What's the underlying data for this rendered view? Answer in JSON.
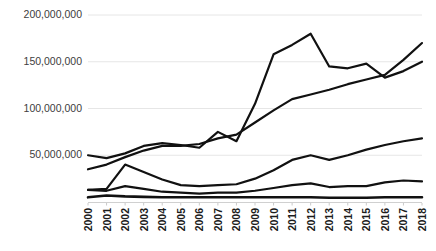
{
  "chart_data": {
    "type": "line",
    "title": "",
    "subtitle": "",
    "xlabel": "",
    "ylabel": "",
    "x": [
      2000,
      2001,
      2002,
      2003,
      2004,
      2005,
      2006,
      2007,
      2008,
      2009,
      2010,
      2011,
      2012,
      2013,
      2014,
      2015,
      2016,
      2017,
      2018
    ],
    "categories": [
      "2000",
      "2001",
      "2002",
      "2003",
      "2004",
      "2005",
      "2006",
      "2007",
      "2008",
      "2009",
      "2010",
      "2011",
      "2012",
      "2013",
      "2014",
      "2015",
      "2016",
      "2017",
      "2018"
    ],
    "ylim": [
      0,
      210000000
    ],
    "xlim": [
      2000,
      2018
    ],
    "y_ticks": [
      50000000,
      100000000,
      150000000,
      200000000
    ],
    "y_tick_labels": [
      "50,000,000",
      "100,000,000",
      "150,000,000",
      "200,000,000"
    ],
    "grid": true,
    "grid_axis": "y",
    "grid_color": "#e6e6e6",
    "legend": false,
    "legend_position": "none",
    "line_color": "#111111",
    "series": [
      {
        "name": "series-1",
        "color": "#111111",
        "width": 2.2,
        "values": [
          50000000,
          47000000,
          52000000,
          60000000,
          63000000,
          61000000,
          58000000,
          75000000,
          65000000,
          105000000,
          158000000,
          168000000,
          180000000,
          145000000,
          143000000,
          148000000,
          133000000,
          140000000,
          150000000
        ]
      },
      {
        "name": "series-2",
        "color": "#111111",
        "width": 2.2,
        "values": [
          35000000,
          40000000,
          48000000,
          55000000,
          60000000,
          60000000,
          62000000,
          68000000,
          72000000,
          85000000,
          98000000,
          110000000,
          115000000,
          120000000,
          126000000,
          131000000,
          136000000,
          152000000,
          170000000
        ]
      },
      {
        "name": "series-3",
        "color": "#111111",
        "width": 2.2,
        "values": [
          13000000,
          14000000,
          40000000,
          32000000,
          24000000,
          18000000,
          17000000,
          18000000,
          19000000,
          25000000,
          34000000,
          45000000,
          50000000,
          45000000,
          50000000,
          56000000,
          61000000,
          65000000,
          68000000
        ]
      },
      {
        "name": "series-4",
        "color": "#111111",
        "width": 2.2,
        "values": [
          13000000,
          12000000,
          17000000,
          14000000,
          11000000,
          10000000,
          9000000,
          10000000,
          10000000,
          12000000,
          15000000,
          18000000,
          20000000,
          16000000,
          17000000,
          17000000,
          21000000,
          23000000,
          22000000
        ]
      },
      {
        "name": "series-5",
        "color": "#111111",
        "width": 2.6,
        "values": [
          5000000,
          7000000,
          6000000,
          5500000,
          5000000,
          5000000,
          5000000,
          5000000,
          5000000,
          5000000,
          5000000,
          5000000,
          5000000,
          4500000,
          4500000,
          4500000,
          5000000,
          5000000,
          5000000
        ]
      }
    ]
  }
}
